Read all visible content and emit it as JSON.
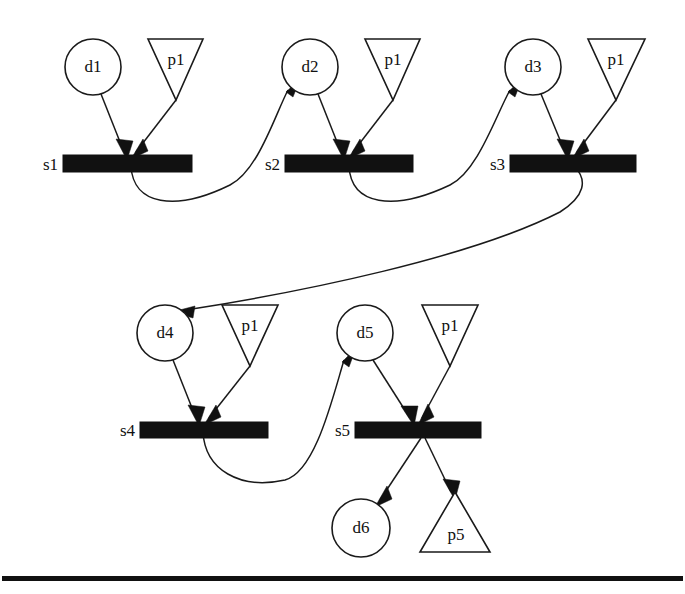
{
  "diagram": {
    "kind": "petri-net",
    "background_color": "#ffffff",
    "stroke_color": "#1a1a1a",
    "fill_color": "#111111",
    "places": [
      {
        "id": "s1",
        "label": "s1",
        "x": 63,
        "y": 155,
        "width": 129,
        "height": 17,
        "label_x": 58,
        "label_y": 165
      },
      {
        "id": "s2",
        "label": "s2",
        "x": 285,
        "y": 155,
        "width": 128,
        "height": 17,
        "label_x": 280,
        "label_y": 165
      },
      {
        "id": "s3",
        "label": "s3",
        "x": 510,
        "y": 155,
        "width": 126,
        "height": 17,
        "label_x": 505,
        "label_y": 165
      },
      {
        "id": "s4",
        "label": "s4",
        "x": 140,
        "y": 422,
        "width": 128,
        "height": 16,
        "label_x": 135,
        "label_y": 431
      },
      {
        "id": "s5",
        "label": "s5",
        "x": 355,
        "y": 422,
        "width": 126,
        "height": 16,
        "label_x": 350,
        "label_y": 431
      }
    ],
    "circles": [
      {
        "id": "d1",
        "label": "d1",
        "cx": 93,
        "cy": 67,
        "r": 28
      },
      {
        "id": "d2",
        "label": "d2",
        "cx": 310,
        "cy": 67,
        "r": 28
      },
      {
        "id": "d3",
        "label": "d3",
        "cx": 533,
        "cy": 67,
        "r": 28
      },
      {
        "id": "d4",
        "label": "d4",
        "cx": 165,
        "cy": 333,
        "r": 28
      },
      {
        "id": "d5",
        "label": "d5",
        "cx": 365,
        "cy": 333,
        "r": 28
      },
      {
        "id": "d6",
        "label": "d6",
        "cx": 361,
        "cy": 528,
        "r": 29
      }
    ],
    "triangles": [
      {
        "id": "t1",
        "label": "p1",
        "direction": "down",
        "left": 148,
        "right": 203,
        "top": 39,
        "bottom": 100,
        "label_x": 176,
        "label_y": 60
      },
      {
        "id": "t2",
        "label": "p1",
        "direction": "down",
        "left": 365,
        "right": 420,
        "top": 39,
        "bottom": 100,
        "label_x": 393,
        "label_y": 60
      },
      {
        "id": "t3",
        "label": "p1",
        "direction": "down",
        "left": 588,
        "right": 645,
        "top": 39,
        "bottom": 100,
        "label_x": 616,
        "label_y": 60
      },
      {
        "id": "t4",
        "label": "p1",
        "direction": "down",
        "left": 222,
        "right": 278,
        "top": 305,
        "bottom": 366,
        "label_x": 250,
        "label_y": 326
      },
      {
        "id": "t5",
        "label": "p1",
        "direction": "down",
        "left": 422,
        "right": 478,
        "top": 305,
        "bottom": 366,
        "label_x": 450,
        "label_y": 326
      },
      {
        "id": "t6",
        "label": "p5",
        "direction": "up",
        "left": 420,
        "right": 490,
        "top": 492,
        "bottom": 552,
        "label_x": 456,
        "label_y": 534
      }
    ],
    "edges": [
      {
        "id": "e-d1-s1",
        "from": "d1",
        "to": "s1",
        "style": "straight"
      },
      {
        "id": "e-t1-s1",
        "from": "t1",
        "to": "s1",
        "style": "straight"
      },
      {
        "id": "e-s1-d2",
        "from": "s1",
        "to": "d2",
        "style": "curved"
      },
      {
        "id": "e-d2-s2",
        "from": "d2",
        "to": "s2",
        "style": "straight"
      },
      {
        "id": "e-t2-s2",
        "from": "t2",
        "to": "s2",
        "style": "straight"
      },
      {
        "id": "e-s2-d3",
        "from": "s2",
        "to": "d3",
        "style": "curved"
      },
      {
        "id": "e-d3-s3",
        "from": "d3",
        "to": "s3",
        "style": "straight"
      },
      {
        "id": "e-t3-s3",
        "from": "t3",
        "to": "s3",
        "style": "straight"
      },
      {
        "id": "e-s3-d4",
        "from": "s3",
        "to": "d4",
        "style": "long-curve"
      },
      {
        "id": "e-d4-s4",
        "from": "d4",
        "to": "s4",
        "style": "straight"
      },
      {
        "id": "e-t4-s4",
        "from": "t4",
        "to": "s4",
        "style": "straight"
      },
      {
        "id": "e-s4-d5",
        "from": "s4",
        "to": "d5",
        "style": "curved"
      },
      {
        "id": "e-d5-s5",
        "from": "d5",
        "to": "s5",
        "style": "straight"
      },
      {
        "id": "e-t5-s5",
        "from": "t5",
        "to": "s5",
        "style": "straight"
      },
      {
        "id": "e-s5-d6",
        "from": "s5",
        "to": "d6",
        "style": "straight"
      },
      {
        "id": "e-s5-t6",
        "from": "s5",
        "to": "t6",
        "style": "straight"
      }
    ],
    "footer_rule": {
      "x": 2,
      "y": 576,
      "width": 681,
      "height": 5
    }
  }
}
